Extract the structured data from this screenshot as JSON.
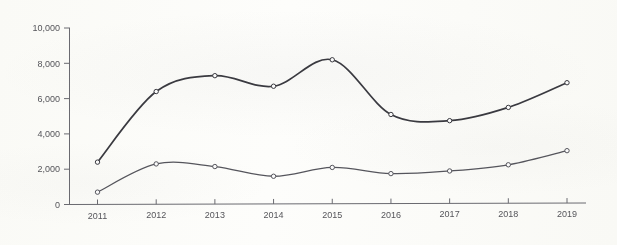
{
  "chart_data": {
    "type": "line",
    "title": "",
    "subtitle": "",
    "xlabel": "",
    "ylabel": "",
    "categories": [
      "2011",
      "2012",
      "2013",
      "2014",
      "2015",
      "2016",
      "2017",
      "2018",
      "2019"
    ],
    "x": [
      2011,
      2012,
      2013,
      2014,
      2015,
      2016,
      2017,
      2018,
      2019
    ],
    "series": [
      {
        "name": "Upper series",
        "values": [
          2400,
          6400,
          7300,
          6700,
          8200,
          5100,
          4750,
          5500,
          6900
        ]
      },
      {
        "name": "Lower series",
        "values": [
          700,
          2300,
          2150,
          1600,
          2100,
          1750,
          1900,
          2250,
          3050
        ]
      }
    ],
    "ylim": [
      0,
      10000
    ],
    "y_ticks": [
      0,
      2000,
      4000,
      6000,
      8000,
      10000
    ],
    "y_tick_labels": [
      "0",
      "2,000",
      "4,000",
      "6,000",
      "8,000",
      "10,000"
    ],
    "x_tick_labels": [
      "2011",
      "2012",
      "2013",
      "2014",
      "2015",
      "2016",
      "2017",
      "2018",
      "2019"
    ],
    "grid": false,
    "legend": "none",
    "markers": "open-circle",
    "interpolation": "smooth-spline",
    "annotations": []
  },
  "axes": {
    "y_axis_name": "value-axis",
    "x_axis_name": "year-axis"
  },
  "colors": {
    "series_primary": "#3a3a40",
    "series_secondary": "#55555c",
    "axis": "#6a6a70",
    "tick_text": "#55555a",
    "background": "#fdfdfb",
    "marker_fill": "#fafafa"
  }
}
